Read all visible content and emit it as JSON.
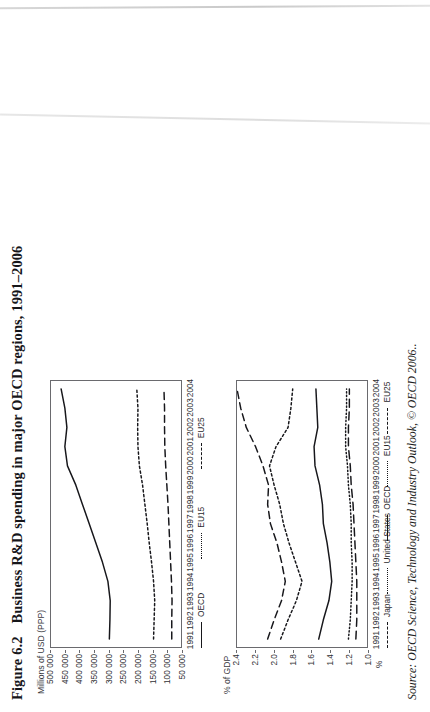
{
  "figure": {
    "number": "Figure 6.2",
    "title": "Business R&D spending in major OECD regions, 1991–2006",
    "source": "Source: OECD Science, Technology and Industry Outlook, © OECD 2006.."
  },
  "chart_data": [
    {
      "id": "top",
      "type": "line",
      "title": "",
      "xlabel": "",
      "ylabel": "Millions of USD (PPP)",
      "yunit": "",
      "ylim": [
        50000,
        500000
      ],
      "yticks": [
        50000,
        100000,
        150000,
        200000,
        250000,
        300000,
        350000,
        400000,
        450000,
        500000
      ],
      "ytick_labels": [
        "50 000",
        "100 000",
        "150 000",
        "200 000",
        "250 000",
        "300 000",
        "350 000",
        "400 000",
        "450 000",
        "500 000"
      ],
      "x": [
        1991,
        1992,
        1993,
        1994,
        1995,
        1996,
        1997,
        1998,
        1999,
        2000,
        2001,
        2002,
        2003,
        2004
      ],
      "xtick_labels": [
        "1991",
        "1992",
        "1993",
        "1994",
        "1995",
        "1996",
        "1997",
        "1998",
        "1999",
        "2000",
        "2001",
        "2002",
        "2003",
        "2004"
      ],
      "grid": false,
      "legend_position": "bottom",
      "series": [
        {
          "name": "OECD",
          "style": "solid",
          "values": [
            298000,
            296000,
            295000,
            303000,
            322000,
            345000,
            368000,
            391000,
            414000,
            443000,
            452000,
            445000,
            452000,
            465000
          ]
        },
        {
          "name": "EU15",
          "style": "dotted",
          "values": [
            145000,
            143000,
            141000,
            145000,
            152000,
            160000,
            167000,
            175000,
            183000,
            194000,
            199000,
            200000,
            199000,
            203000
          ]
        },
        {
          "name": "EU25",
          "style": "dashed",
          "values": [
            82000,
            82000,
            81000,
            83000,
            86000,
            89000,
            92000,
            95000,
            99000,
            103000,
            106000,
            107000,
            107000,
            109000
          ]
        }
      ]
    },
    {
      "id": "bottom",
      "type": "line",
      "title": "",
      "xlabel": "",
      "ylabel": "% of GDP",
      "yunit": "%",
      "ylim": [
        1.0,
        2.4
      ],
      "yticks": [
        1.0,
        1.2,
        1.4,
        1.6,
        1.8,
        2.0,
        2.2,
        2.4
      ],
      "ytick_labels": [
        "1.0",
        "1.2",
        "1.4",
        "1.6",
        "1.8",
        "2.0",
        "2.2",
        "2.4"
      ],
      "x": [
        1991,
        1992,
        1993,
        1994,
        1995,
        1996,
        1997,
        1998,
        1999,
        2000,
        2001,
        2002,
        2003,
        2004
      ],
      "xtick_labels": [
        "1991",
        "1992",
        "1993",
        "1994",
        "1995",
        "1996",
        "1997",
        "1998",
        "1999",
        "2000",
        "2001",
        "2002",
        "2003",
        "2004"
      ],
      "grid": false,
      "legend_position": "bottom",
      "series": [
        {
          "name": "Japan",
          "style": "dashed",
          "values": [
            2.07,
            2.0,
            1.92,
            1.88,
            1.92,
            1.97,
            2.04,
            2.07,
            2.06,
            2.12,
            2.2,
            2.3,
            2.36,
            2.4
          ]
        },
        {
          "name": "United States",
          "style": "dotted",
          "values": [
            1.93,
            1.85,
            1.76,
            1.7,
            1.77,
            1.84,
            1.9,
            1.94,
            2.0,
            2.05,
            1.98,
            1.85,
            1.82,
            1.8
          ]
        },
        {
          "name": "OECD",
          "style": "solid",
          "values": [
            1.52,
            1.47,
            1.41,
            1.38,
            1.4,
            1.43,
            1.47,
            1.48,
            1.51,
            1.56,
            1.57,
            1.53,
            1.54,
            1.55
          ]
        },
        {
          "name": "EU15",
          "style": "finedot",
          "values": [
            1.2,
            1.18,
            1.17,
            1.16,
            1.16,
            1.17,
            1.17,
            1.18,
            1.2,
            1.21,
            1.23,
            1.23,
            1.22,
            1.22
          ]
        },
        {
          "name": "EU25",
          "style": "longdash",
          "values": [
            1.12,
            1.11,
            1.11,
            1.11,
            1.12,
            1.13,
            1.14,
            1.15,
            1.17,
            1.18,
            1.2,
            1.2,
            1.19,
            1.19
          ]
        }
      ]
    }
  ]
}
